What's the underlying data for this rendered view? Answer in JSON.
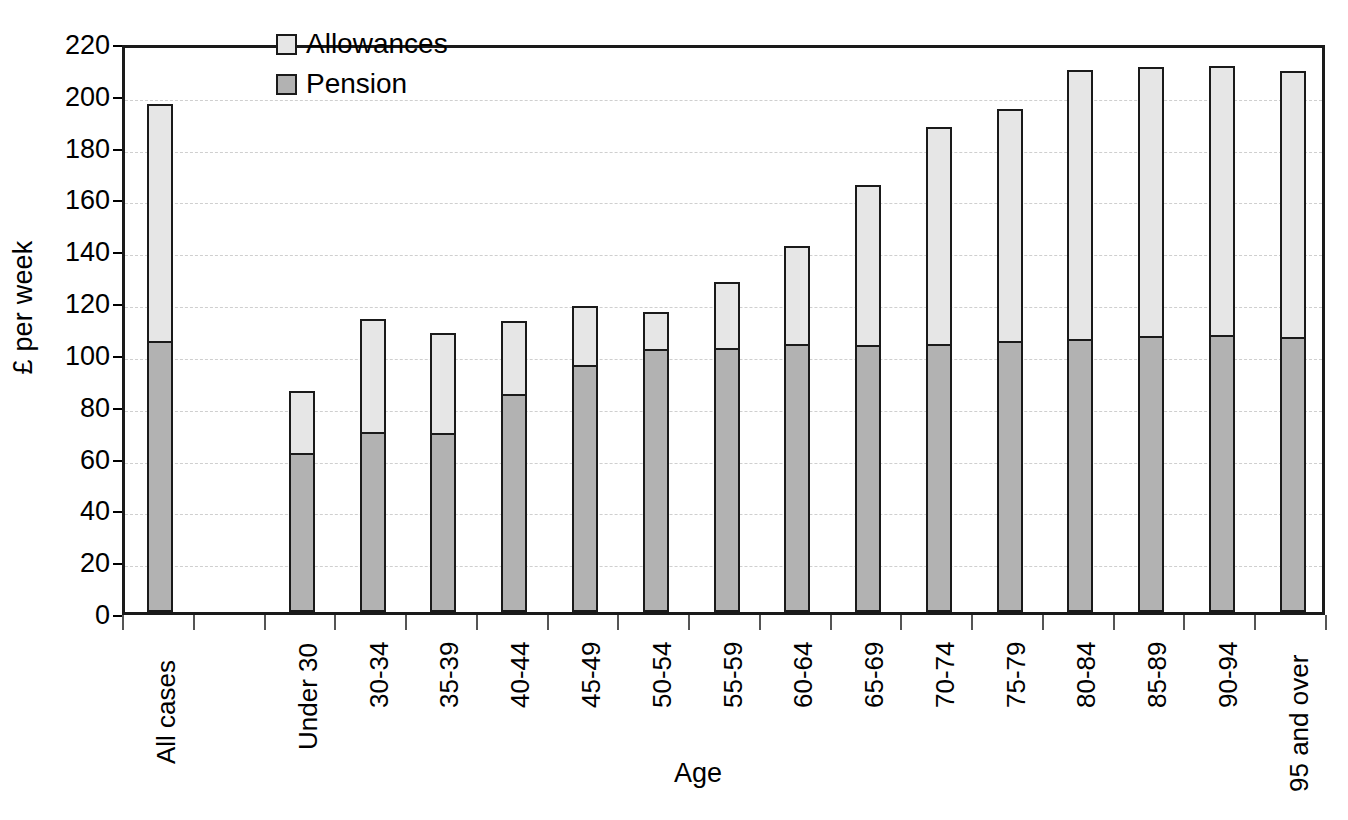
{
  "chart_data": {
    "type": "bar",
    "subtype": "stacked-bar",
    "title": "",
    "xlabel": "Age",
    "ylabel": "£ per week",
    "ylim": [
      0,
      220
    ],
    "yticks": [
      0,
      20,
      40,
      60,
      80,
      100,
      120,
      140,
      160,
      180,
      200,
      220
    ],
    "ytick_labels": [
      "0",
      "20",
      "40",
      "60",
      "80",
      "100",
      "120",
      "140",
      "160",
      "180",
      "200",
      "220"
    ],
    "grid": true,
    "grid_axis": "y",
    "legend_position": "top-left-inside",
    "categories": [
      "All cases",
      "",
      "Under 30",
      "30-34",
      "35-39",
      "40-44",
      "45-49",
      "50-54",
      "55-59",
      "60-64",
      "65-69",
      "70-74",
      "75-79",
      "80-84",
      "85-89",
      "90-94",
      "95 and over"
    ],
    "series": [
      {
        "name": "Pension",
        "color": "#b2b2b2",
        "values": [
          104.5,
          null,
          61.5,
          69.5,
          69.0,
          84.0,
          95.5,
          101.5,
          102.0,
          103.5,
          103.0,
          103.5,
          104.5,
          105.5,
          106.5,
          107.0,
          106.0
        ]
      },
      {
        "name": "Allowances",
        "color": "#e6e6e6",
        "values": [
          92.5,
          null,
          24.5,
          44.5,
          39.5,
          29.0,
          23.5,
          15.0,
          26.0,
          38.5,
          62.5,
          84.5,
          90.5,
          104.5,
          104.5,
          104.5,
          103.5
        ]
      }
    ],
    "totals": [
      197.0,
      null,
      86.0,
      114.0,
      108.5,
      113.0,
      119.0,
      116.5,
      128.0,
      142.0,
      165.5,
      188.0,
      195.0,
      210.0,
      211.0,
      211.5,
      209.5
    ]
  },
  "legend": {
    "items": [
      {
        "label": "Allowances",
        "swatch_class": "allowances"
      },
      {
        "label": "Pension",
        "swatch_class": "pension"
      }
    ]
  },
  "axes": {
    "y_title": "£ per week",
    "x_title": "Age"
  },
  "colors": {
    "pension": "#b2b2b2",
    "allowances": "#e6e6e6",
    "axis": "#1a1a1a",
    "gridline": "#cfcfcf",
    "background": "#ffffff"
  }
}
